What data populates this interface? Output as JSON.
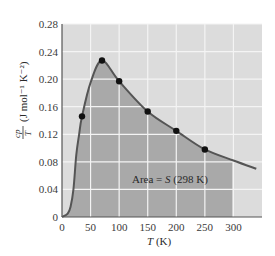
{
  "chart_data": {
    "type": "line",
    "title": "",
    "xlabel": "T (K)",
    "ylabel": "Cp/T (J mol⁻¹ K⁻²)",
    "xlim": [
      0,
      350
    ],
    "ylim": [
      0,
      0.28
    ],
    "x_ticks": [
      "0",
      "50",
      "100",
      "150",
      "200",
      "250",
      "300"
    ],
    "y_ticks": [
      "0",
      "0.04",
      "0.08",
      "0.12",
      "0.16",
      "0.20",
      "0.24",
      "0.28"
    ],
    "grid": true,
    "legend": null,
    "annotation": "Area = S (298 K)",
    "shaded_region": {
      "from_x": 0,
      "to_x": 298
    },
    "series": [
      {
        "name": "measured Cp/T",
        "markers": true,
        "x": [
          35,
          70,
          100,
          150,
          200,
          250
        ],
        "y": [
          0.146,
          0.227,
          0.197,
          0.153,
          0.125,
          0.098
        ]
      },
      {
        "name": "fitted curve",
        "markers": false,
        "x": [
          0,
          10,
          15,
          20,
          25,
          30,
          35,
          50,
          70,
          100,
          150,
          200,
          250,
          300,
          340
        ],
        "y": [
          0,
          0.005,
          0.015,
          0.04,
          0.09,
          0.12,
          0.146,
          0.195,
          0.227,
          0.197,
          0.153,
          0.125,
          0.098,
          0.082,
          0.07
        ]
      }
    ]
  },
  "labels": {
    "area": "Area = ",
    "area_s": "S",
    "area_tail": " (298 K)",
    "x_axis_T": "T",
    "x_axis_unit": " (K)",
    "y_axis": "(J mol⁻¹ K⁻²)",
    "y_frac_num": "cp",
    "y_frac_den": "T"
  }
}
